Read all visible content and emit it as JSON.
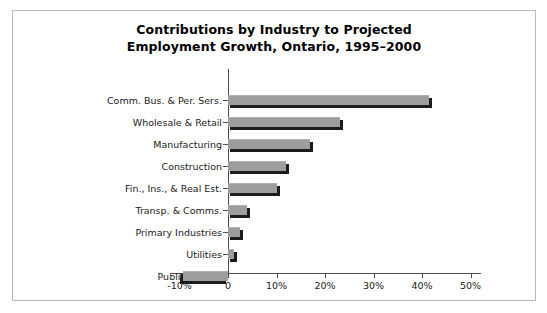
{
  "chart_data": {
    "type": "bar",
    "orientation": "horizontal",
    "title": "Contributions by Industry to Projected Employment Growth, Ontario, 1995–2000",
    "title_line1": "Contributions by Industry to Projected",
    "title_line2": "Employment Growth, Ontario, 1995–2000",
    "xlabel": "",
    "ylabel": "",
    "categories": [
      "Comm. Bus. & Per. Sers.",
      "Wholesale & Retail",
      "Manufacturing",
      "Construction",
      "Fin., Ins., & Real Est.",
      "Transp. & Comms.",
      "Primary Industries",
      "Utilities",
      "Public Admin."
    ],
    "values": [
      41.5,
      23.1,
      16.9,
      12.0,
      10.1,
      3.9,
      2.5,
      1.2,
      -9.3
    ],
    "value_unit": "%",
    "xlim": [
      -10,
      50
    ],
    "xticks": [
      -10,
      0,
      10,
      20,
      30,
      40,
      50
    ],
    "xtick_labels": [
      "-10%",
      "0",
      "10%",
      "20%",
      "30%",
      "40%",
      "50%"
    ],
    "grid": false,
    "legend": false,
    "bar_fill_color": "#9d9d9d",
    "bar_shadow_color": "#1c1c1c",
    "axis_color": "#4d4d4d",
    "background_color": "#ffffff",
    "frame_color": "#b9b9b9"
  }
}
